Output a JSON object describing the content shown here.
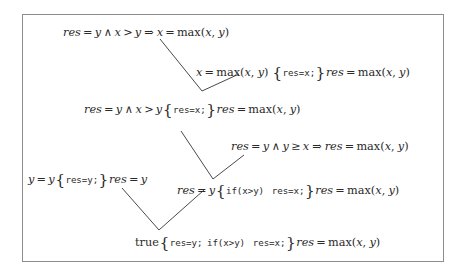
{
  "figure": {
    "kind": "hoare-logic-proof-derivation",
    "border_color": "#8d8d8d",
    "text_color": "#2a2a2a",
    "background": "#ffffff"
  },
  "nodes": [
    {
      "id": "n1",
      "role": "premise-implication",
      "text": "res = y ∧ x > y ⇒ x = max(x, y)",
      "parts": {
        "res": "res",
        "eq1": "=",
        "y1": "y",
        "wedge": "∧",
        "x1": "x",
        "gt": ">",
        "y2": "y",
        "implies": "⇒",
        "x2": "x",
        "eq2": "=",
        "max": "max",
        "open": "(",
        "mx": "x",
        "comma": ",",
        "my": "y",
        "close": ")"
      }
    },
    {
      "id": "n2",
      "role": "hoare-triple-assignment",
      "text": "x = max(x, y) {res=x;} res = max(x, y)",
      "parts": {
        "pre_x": "x",
        "eq1": "=",
        "max1": "max",
        "open1": "(",
        "px": "x",
        "comma1": ",",
        "py": "y",
        "close1": ")",
        "brace_open": "{",
        "code": "res=x;",
        "brace_close": "}",
        "post_res": "res",
        "eq2": "=",
        "max2": "max",
        "open2": "(",
        "qx": "x",
        "comma2": ",",
        "qy": "y",
        "close2": ")"
      }
    },
    {
      "id": "n3",
      "role": "hoare-triple-derived",
      "text": "res = y ∧ x > y {res=x;} res = max(x, y)",
      "parts": {
        "res": "res",
        "eq1": "=",
        "y1": "y",
        "wedge": "∧",
        "x1": "x",
        "gt": ">",
        "y2": "y",
        "brace_open": "{",
        "code": "res=x;",
        "brace_close": "}",
        "post_res": "res",
        "eq2": "=",
        "max": "max",
        "open": "(",
        "mx": "x",
        "comma": ",",
        "my": "y",
        "close": ")"
      }
    },
    {
      "id": "n4",
      "role": "premise-implication",
      "text": "res = y ∧ y ≥ x ⇒ res = max(x, y)",
      "parts": {
        "res1": "res",
        "eq1": "=",
        "y1": "y",
        "wedge": "∧",
        "y2": "y",
        "geq": "≥",
        "x1": "x",
        "implies": "⇒",
        "res2": "res",
        "eq2": "=",
        "max": "max",
        "open": "(",
        "mx": "x",
        "comma": ",",
        "my": "y",
        "close": ")"
      }
    },
    {
      "id": "n5",
      "role": "hoare-triple-assignment",
      "text": "y = y {res=y;} res = y",
      "parts": {
        "y1": "y",
        "eq1": "=",
        "y2": "y",
        "brace_open": "{",
        "code": "res=y;",
        "brace_close": "}",
        "res": "res",
        "eq2": "=",
        "y3": "y"
      }
    },
    {
      "id": "n6",
      "role": "hoare-triple-conditional",
      "text": "res = y {if(x>y)  res=x;} res = max(x, y)",
      "parts": {
        "res1": "res",
        "eq1": "=",
        "y1": "y",
        "brace_open": "{",
        "code_if": "if(x>y)",
        "code_assign": "res=x;",
        "brace_close": "}",
        "res2": "res",
        "eq2": "=",
        "max": "max",
        "open": "(",
        "mx": "x",
        "comma": ",",
        "my": "y",
        "close": ")"
      }
    },
    {
      "id": "n7",
      "role": "hoare-triple-conclusion",
      "text": "true{res=y; if(x>y)  res=x;} res = max(x, y)",
      "parts": {
        "true": "true",
        "brace_open": "{",
        "code_assign_y": "res=y;",
        "code_if": "if(x>y)",
        "code_assign_x": "res=x;",
        "brace_close": "}",
        "res": "res",
        "eq": "=",
        "max": "max",
        "open": "(",
        "mx": "x",
        "comma": ",",
        "my": "y",
        "close": ")"
      }
    }
  ],
  "connectors": [
    {
      "id": "c1",
      "from_left": "n1",
      "from_right": "n2",
      "to": "n3",
      "points": "160,39 202,91 239,74"
    },
    {
      "id": "c2",
      "from_left": "n3",
      "from_right": "n4",
      "to": "n6",
      "points": "181,131 213,179 244,155"
    },
    {
      "id": "c3",
      "from_left": "n5",
      "from_right": "n6",
      "to": "n7",
      "points": "122,188 159,230 204,190"
    }
  ]
}
